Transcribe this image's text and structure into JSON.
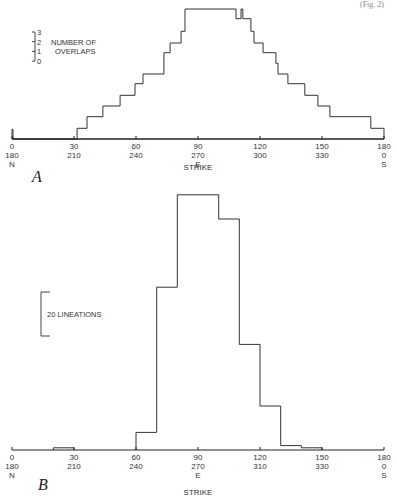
{
  "corner_text": "(Fig. 2)",
  "chart_data": [
    {
      "panel": "A",
      "type": "line",
      "step": true,
      "xlabel": "STRIKE",
      "ylabel": "NUMBER OF OVERLAPS",
      "scale_bar": {
        "ticks": [
          "3",
          "2",
          "1",
          "0"
        ],
        "label_line1": "NUMBER OF",
        "label_line2": "OVERLAPS"
      },
      "x_ticks": [
        {
          "v": 0,
          "l1": "0",
          "l2": "180",
          "l3": "N"
        },
        {
          "v": 30,
          "l1": "30",
          "l2": "210",
          "l3": ""
        },
        {
          "v": 60,
          "l1": "60",
          "l2": "240",
          "l3": ""
        },
        {
          "v": 90,
          "l1": "90",
          "l2": "270",
          "l3": "E"
        },
        {
          "v": 120,
          "l1": "120",
          "l2": "300",
          "l3": ""
        },
        {
          "v": 150,
          "l1": "150",
          "l2": "330",
          "l3": ""
        },
        {
          "v": 180,
          "l1": "180",
          "l2": "0",
          "l3": "S"
        }
      ],
      "xlim": [
        0,
        180
      ],
      "ylim": [
        0,
        14
      ],
      "steps": [
        [
          0,
          0
        ],
        [
          0,
          1
        ],
        [
          0.5,
          1
        ],
        [
          0.5,
          0
        ],
        [
          31.5,
          0
        ],
        [
          31.5,
          1.1
        ],
        [
          36.3,
          1.1
        ],
        [
          36.3,
          2.3
        ],
        [
          44,
          2.3
        ],
        [
          44,
          3.4
        ],
        [
          52.3,
          3.4
        ],
        [
          52.3,
          4.5
        ],
        [
          59.5,
          4.5
        ],
        [
          59.5,
          5.7
        ],
        [
          63.4,
          5.7
        ],
        [
          63.4,
          6.7
        ],
        [
          73.5,
          6.7
        ],
        [
          73.5,
          8.9
        ],
        [
          76.5,
          8.9
        ],
        [
          76.5,
          9.9
        ],
        [
          81.8,
          9.9
        ],
        [
          81.8,
          11.1
        ],
        [
          83.7,
          11.1
        ],
        [
          83.7,
          13.4
        ],
        [
          108.4,
          13.4
        ],
        [
          108.4,
          12.4
        ],
        [
          110.8,
          12.4
        ],
        [
          110.8,
          13.4
        ],
        [
          111.7,
          13.4
        ],
        [
          111.7,
          12.4
        ],
        [
          115.6,
          12.4
        ],
        [
          115.6,
          11.1
        ],
        [
          117.1,
          11.1
        ],
        [
          117.1,
          9.9
        ],
        [
          121.5,
          9.9
        ],
        [
          121.5,
          8.9
        ],
        [
          127.7,
          8.9
        ],
        [
          127.7,
          7.8
        ],
        [
          128.7,
          7.8
        ],
        [
          128.7,
          6.7
        ],
        [
          133.5,
          6.7
        ],
        [
          133.5,
          5.7
        ],
        [
          141.7,
          5.7
        ],
        [
          141.7,
          4.5
        ],
        [
          148,
          4.5
        ],
        [
          148,
          3.4
        ],
        [
          153.8,
          3.4
        ],
        [
          153.8,
          2.3
        ],
        [
          173.6,
          2.3
        ],
        [
          173.6,
          1.1
        ],
        [
          180,
          1.1
        ],
        [
          180,
          0
        ]
      ]
    },
    {
      "panel": "B",
      "type": "bar",
      "histogram": true,
      "xlabel": "STRIKE",
      "ylabel": "LINEATIONS",
      "scale_bar": {
        "value": 20,
        "label": "20  LINEATIONS"
      },
      "x_ticks": [
        {
          "v": 0,
          "l1": "0",
          "l2": "180",
          "l3": "N"
        },
        {
          "v": 30,
          "l1": "30",
          "l2": "210",
          "l3": ""
        },
        {
          "v": 60,
          "l1": "60",
          "l2": "240",
          "l3": ""
        },
        {
          "v": 90,
          "l1": "90",
          "l2": "270",
          "l3": "E"
        },
        {
          "v": 120,
          "l1": "120",
          "l2": "310",
          "l3": ""
        },
        {
          "v": 150,
          "l1": "150",
          "l2": "330",
          "l3": ""
        },
        {
          "v": 180,
          "l1": "180",
          "l2": "0",
          "l3": "S"
        }
      ],
      "xlim": [
        0,
        180
      ],
      "ylim": [
        0,
        120
      ],
      "categories": [
        "20-30",
        "60-70",
        "70-80",
        "80-90",
        "90-100",
        "100-110",
        "110-120",
        "120-130",
        "130-140",
        "140-150"
      ],
      "bins": [
        {
          "from": 20,
          "to": 30,
          "value": 1
        },
        {
          "from": 60,
          "to": 70,
          "value": 8
        },
        {
          "from": 70,
          "to": 80,
          "value": 74
        },
        {
          "from": 80,
          "to": 90,
          "value": 116
        },
        {
          "from": 90,
          "to": 100,
          "value": 116
        },
        {
          "from": 100,
          "to": 110,
          "value": 105
        },
        {
          "from": 110,
          "to": 120,
          "value": 48
        },
        {
          "from": 120,
          "to": 130,
          "value": 20
        },
        {
          "from": 130,
          "to": 140,
          "value": 2
        },
        {
          "from": 140,
          "to": 150,
          "value": 1
        }
      ],
      "values": [
        1,
        8,
        74,
        116,
        116,
        105,
        48,
        20,
        2,
        1
      ]
    }
  ]
}
